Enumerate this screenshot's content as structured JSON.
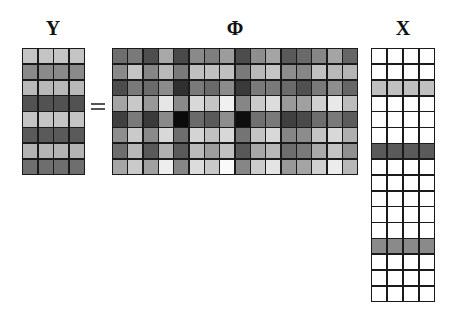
{
  "labels": {
    "y": "Y",
    "phi": "Φ",
    "x": "X"
  },
  "operator": "=",
  "matrices": {
    "Y": {
      "rows": 8,
      "cols": 4,
      "row_colors": [
        "#c4c4c4",
        "#8a8a8a",
        "#b8b8b8",
        "#525252",
        "#c4c4c4",
        "#5a5a5a",
        "#b4b4b4",
        "#6e6e6e"
      ]
    },
    "PHI": {
      "rows": 8,
      "cols": 16,
      "cells": [
        [
          "#6e6e6e",
          "#7a7a7a",
          "#4e4e4e",
          "#a8a8a8",
          "#4a4a4a",
          "#8a8a8a",
          "#7e7e7e",
          "#9c9c9c",
          "#4c4c4c",
          "#8e8e8e",
          "#a4a4a4",
          "#5a5a5a",
          "#6a6a6a",
          "#868686",
          "#a4a4a4",
          "#666666"
        ],
        [
          "#8a8a8a",
          "#c4c4c4",
          "#868686",
          "#b8b8b8",
          "#7a7a7a",
          "#c0c0c0",
          "#c0c0c0",
          "#c0c0c0",
          "#7a7a7a",
          "#b8b8b8",
          "#c4c4c4",
          "#8e8e8e",
          "#868686",
          "#c0c0c0",
          "#b8b8b8",
          "#b4b4b4"
        ],
        [
          "#4c4c4c",
          "#7a7a7a",
          "#6a6a6a",
          "#8c8c8c",
          "#303030",
          "#7a7a7a",
          "#6a6a6a",
          "#8c8c8c",
          "#3a3a3a",
          "#7a7a7a",
          "#7a7a7a",
          "#6a6a6a",
          "#505050",
          "#7a7a7a",
          "#8e8e8e",
          "#666666"
        ],
        [
          "#a4a4a4",
          "#c8c8c8",
          "#989898",
          "#e6e6e6",
          "#8a8a8a",
          "#d8d8d8",
          "#c4c4c4",
          "#f0f0f0",
          "#868686",
          "#cacaca",
          "#dcdcdc",
          "#9a9a9a",
          "#a0a0a0",
          "#d0d0d0",
          "#e8e8e8",
          "#bcbcbc"
        ],
        [
          "#404040",
          "#7a7a7a",
          "#3a3a3a",
          "#8a8a8a",
          "#0a0a0a",
          "#6a6a6a",
          "#5a5a5a",
          "#8e8e8e",
          "#0e0e0e",
          "#707070",
          "#7a7a7a",
          "#404040",
          "#4a4a4a",
          "#6e6e6e",
          "#7a7a7a",
          "#5c5c5c"
        ],
        [
          "#8e8e8e",
          "#cacaca",
          "#8a8a8a",
          "#d8d8d8",
          "#6e6e6e",
          "#d4d4d4",
          "#c0c0c0",
          "#d8d8d8",
          "#747474",
          "#c4c4c4",
          "#d8d8d8",
          "#868686",
          "#8c8c8c",
          "#c4c4c4",
          "#d8d8d8",
          "#b0b0b0"
        ],
        [
          "#6e6e6e",
          "#b8b8b8",
          "#5a5a5a",
          "#b0b0b0",
          "#5a5a5a",
          "#bababa",
          "#9e9e9e",
          "#c0c0c0",
          "#585858",
          "#a8a8a8",
          "#b8b8b8",
          "#6e6e6e",
          "#7a7a7a",
          "#aaaaaa",
          "#c4c4c4",
          "#909090"
        ],
        [
          "#a6a6a6",
          "#cacaca",
          "#a0a0a0",
          "#eeeeee",
          "#868686",
          "#dcdcdc",
          "#c8c8c8",
          "#fafafa",
          "#868686",
          "#cccccc",
          "#e4e4e4",
          "#989898",
          "#a4a4a4",
          "#d0d0d0",
          "#ececec",
          "#b8b8b8"
        ]
      ]
    },
    "X": {
      "rows": 16,
      "cols": 4,
      "row_colors": [
        "#ffffff",
        "#ffffff",
        "#c0c0c0",
        "#ffffff",
        "#ffffff",
        "#ffffff",
        "#5a5a5a",
        "#ffffff",
        "#ffffff",
        "#ffffff",
        "#ffffff",
        "#ffffff",
        "#8a8a8a",
        "#ffffff",
        "#ffffff",
        "#ffffff"
      ]
    }
  }
}
